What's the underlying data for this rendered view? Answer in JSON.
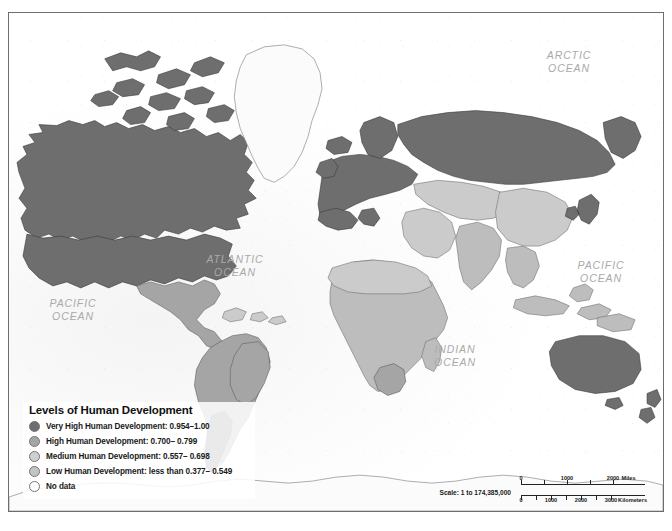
{
  "map": {
    "title": "Levels of Human Development",
    "projection_note": "world map, Robinson-like",
    "frame_border_color": "#6d6d6d",
    "ocean_color": "#fbfbfb"
  },
  "ocean_labels": [
    {
      "name": "arctic-ocean-label",
      "text": "ARCTIC\nOCEAN",
      "x": 558,
      "y": 42
    },
    {
      "name": "atlantic-ocean-label",
      "text": "ATLANTIC\nOCEAN",
      "x": 225,
      "y": 246
    },
    {
      "name": "pacific-ocean-label-east",
      "text": "PACIFIC\nOCEAN",
      "x": 589,
      "y": 252
    },
    {
      "name": "pacific-ocean-label-west",
      "text": "PACIFIC\nOCEAN",
      "x": 62,
      "y": 290
    },
    {
      "name": "indian-ocean-label",
      "text": "INDIAN\nOCEAN",
      "x": 443,
      "y": 336
    }
  ],
  "legend": {
    "title": "Levels of Human Development",
    "items": [
      {
        "label": "Very High Human Development: 0.954–1.00",
        "color": "#6e6e6e",
        "class": "very-high"
      },
      {
        "label": "High Human Development: 0.700– 0.799",
        "color": "#a5a5a5",
        "class": "high"
      },
      {
        "label": "Medium Human Development: 0.557– 0.698",
        "color": "#cfcfcf",
        "class": "medium"
      },
      {
        "label": "Low Human Development: less than 0.377– 0.549",
        "color": "#c4c4c4",
        "class": "low"
      },
      {
        "label": "No data",
        "color": "#ffffff",
        "class": "no-data"
      }
    ]
  },
  "scale": {
    "ratio_label": "Scale: 1 to 174,385,000",
    "miles": {
      "unit": "Miles",
      "ticks": [
        "0",
        "1000",
        "2000"
      ],
      "positions": [
        4,
        50,
        96
      ]
    },
    "kilometers": {
      "unit": "Kilometers",
      "ticks": [
        "0",
        "1000",
        "2000",
        "3000"
      ],
      "positions": [
        4,
        34,
        64,
        94
      ]
    }
  },
  "caption": ""
}
